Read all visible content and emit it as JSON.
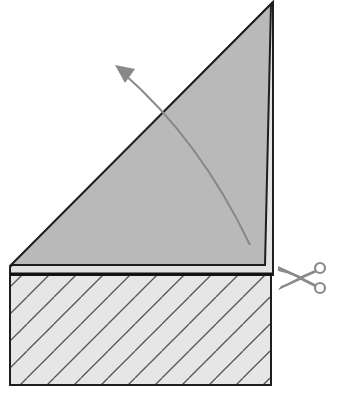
{
  "diagram": {
    "colors": {
      "background": "#ffffff",
      "triangle_fill": "#b9b9b9",
      "strip_fill": "#e2e2e2",
      "hatch_fill": "#e6e6e6",
      "outline": "#1e1e1e",
      "hatch_line": "#555555",
      "arrow": "#888888",
      "scissors": "#8a8a8a"
    },
    "elements": {
      "folded_triangle": {
        "label": "folded-triangle"
      },
      "fold_arrow": {
        "label": "fold-direction-arrow"
      },
      "cut_strip": {
        "label": "excess-strip"
      },
      "scissors": {
        "label": "cut-here-scissors"
      }
    }
  }
}
